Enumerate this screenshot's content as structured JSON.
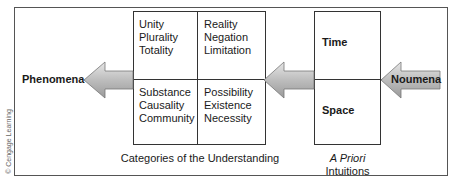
{
  "diagram": {
    "left_label": "Phenomena",
    "right_label": "Noumena",
    "categories": {
      "quantity": [
        "Unity",
        "Plurality",
        "Totality"
      ],
      "quality": [
        "Reality",
        "Negation",
        "Limitation"
      ],
      "relation": [
        "Substance",
        "Causality",
        "Community"
      ],
      "modality": [
        "Possibility",
        "Existence",
        "Necessity"
      ],
      "caption": "Categories of the Understanding"
    },
    "intuitions": {
      "top": "Time",
      "bottom": "Space",
      "caption_italic": "A Priori",
      "caption": "Intuitions"
    },
    "copyright": "© Cengage Learning"
  }
}
